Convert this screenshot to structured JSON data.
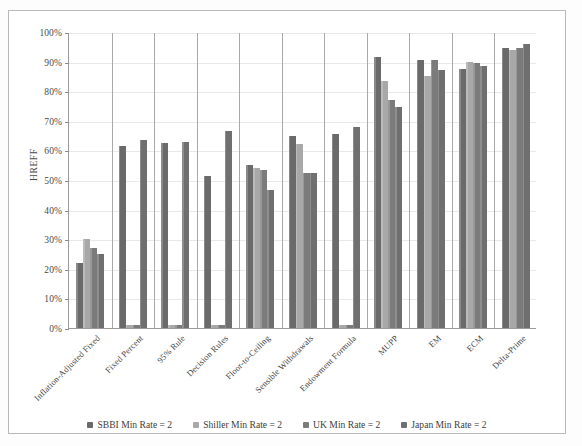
{
  "chart_data": {
    "type": "bar",
    "title": "",
    "subtitle": "",
    "xlabel": "",
    "ylabel": "HREFF",
    "ylim": [
      0,
      100
    ],
    "ytick_labels": [
      "0%",
      "10%",
      "20%",
      "30%",
      "40%",
      "50%",
      "60%",
      "70%",
      "80%",
      "90%",
      "100%"
    ],
    "ytick_values": [
      0,
      10,
      20,
      30,
      40,
      50,
      60,
      70,
      80,
      90,
      100
    ],
    "grid": true,
    "legend_position": "bottom",
    "categories": [
      "Inflation-Adjusted Fixed",
      "Fixed Percent",
      "95% Rule",
      "Decision Rules",
      "Floor-to-Ceiling",
      "Sensible Withdrawals",
      "Endowment Formula",
      "MUPP",
      "EM",
      "ECM",
      "Delta-Prime"
    ],
    "series": [
      {
        "name": "SBBI Min Rate = 2",
        "color": "#6a6a6a",
        "values": [
          22.0,
          61.5,
          62.5,
          51.5,
          55.0,
          65.0,
          65.5,
          91.5,
          90.5,
          87.5,
          94.5
        ]
      },
      {
        "name": "Shiller Min Rate = 2",
        "color": "#a8a8a8",
        "values": [
          30.0,
          1.0,
          1.0,
          1.0,
          54.0,
          62.0,
          1.0,
          83.5,
          85.0,
          90.0,
          94.0
        ]
      },
      {
        "name": "UK Min Rate = 2",
        "color": "#7b7b7b",
        "values": [
          27.0,
          1.0,
          1.0,
          1.0,
          53.5,
          52.5,
          1.0,
          77.0,
          90.5,
          89.5,
          94.5
        ]
      },
      {
        "name": "Japan Min Rate = 2",
        "color": "#6f6f6f",
        "values": [
          25.0,
          63.5,
          63.0,
          66.5,
          46.5,
          52.5,
          68.0,
          74.5,
          87.0,
          88.5,
          96.0
        ]
      }
    ]
  }
}
